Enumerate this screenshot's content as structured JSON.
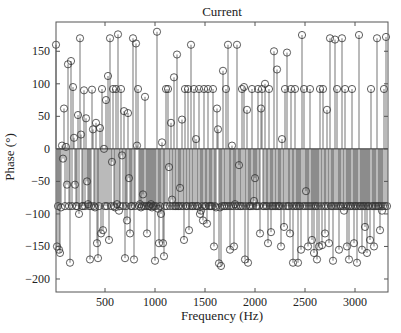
{
  "chart_data": {
    "type": "stem",
    "title": "Current",
    "xlabel": "Frequency (Hz)",
    "ylabel": "Phase (°)",
    "xlim": [
      10,
      3330
    ],
    "ylim": [
      -220,
      195
    ],
    "xticks": [
      500,
      1000,
      1500,
      2000,
      2500,
      3000
    ],
    "yticks": [
      -200,
      -150,
      -100,
      -50,
      0,
      50,
      100,
      150
    ],
    "grid": false,
    "legend": null,
    "marker": "open-circle",
    "color": "#333333",
    "x": [
      10,
      20,
      30,
      40,
      50,
      60,
      70,
      80,
      90,
      100,
      110,
      120,
      130,
      140,
      150,
      160,
      170,
      180,
      190,
      200,
      210,
      220,
      230,
      240,
      250,
      260,
      270,
      280,
      290,
      300,
      310,
      320,
      330,
      340,
      350,
      360,
      370,
      380,
      390,
      400,
      410,
      420,
      430,
      440,
      450,
      460,
      470,
      480,
      490,
      500,
      510,
      520,
      530,
      540,
      550,
      560,
      570,
      580,
      590,
      600,
      610,
      620,
      630,
      640,
      650,
      660,
      670,
      680,
      690,
      700,
      710,
      720,
      730,
      740,
      750,
      760,
      770,
      780,
      790,
      800,
      810,
      820,
      830,
      840,
      850,
      860,
      870,
      880,
      890,
      900,
      910,
      920,
      930,
      940,
      950,
      960,
      970,
      980,
      990,
      1000,
      1010,
      1020,
      1030,
      1040,
      1050,
      1060,
      1070,
      1080,
      1090,
      1100,
      1110,
      1120,
      1130,
      1140,
      1150,
      1160,
      1170,
      1180,
      1190,
      1200,
      1210,
      1220,
      1230,
      1240,
      1250,
      1260,
      1270,
      1280,
      1290,
      1300,
      1310,
      1320,
      1330,
      1340,
      1350,
      1360,
      1370,
      1380,
      1390,
      1400,
      1410,
      1420,
      1430,
      1440,
      1450,
      1460,
      1470,
      1480,
      1490,
      1500,
      1510,
      1520,
      1530,
      1540,
      1550,
      1560,
      1570,
      1580,
      1590,
      1600,
      1610,
      1620,
      1630,
      1640,
      1650,
      1660,
      1670,
      1680,
      1690,
      1700,
      1710,
      1720,
      1730,
      1740,
      1750,
      1760,
      1770,
      1780,
      1790,
      1800,
      1810,
      1820,
      1830,
      1840,
      1850,
      1860,
      1870,
      1880,
      1890,
      1900,
      1910,
      1920,
      1930,
      1940,
      1950,
      1960,
      1970,
      1980,
      1990,
      2000,
      2010,
      2020,
      2030,
      2040,
      2050,
      2060,
      2070,
      2080,
      2090,
      2100,
      2110,
      2120,
      2130,
      2140,
      2150,
      2160,
      2170,
      2180,
      2190,
      2200,
      2210,
      2220,
      2230,
      2240,
      2250,
      2260,
      2270,
      2280,
      2290,
      2300,
      2310,
      2320,
      2330,
      2340,
      2350,
      2360,
      2370,
      2380,
      2390,
      2400,
      2410,
      2420,
      2430,
      2440,
      2450,
      2460,
      2470,
      2480,
      2490,
      2500,
      2510,
      2520,
      2530,
      2540,
      2550,
      2560,
      2570,
      2580,
      2590,
      2600,
      2610,
      2620,
      2630,
      2640,
      2650,
      2660,
      2670,
      2680,
      2690,
      2700,
      2710,
      2720,
      2730,
      2740,
      2750,
      2760,
      2770,
      2780,
      2790,
      2800,
      2810,
      2820,
      2830,
      2840,
      2850,
      2860,
      2870,
      2880,
      2890,
      2900,
      2910,
      2920,
      2930,
      2940,
      2950,
      2960,
      2970,
      2980,
      2990,
      3000,
      3010,
      3020,
      3030,
      3040,
      3050,
      3060,
      3070,
      3080,
      3090,
      3100,
      3110,
      3120,
      3130,
      3140,
      3150,
      3160,
      3170,
      3180,
      3190,
      3200,
      3210,
      3220,
      3230,
      3240,
      3250,
      3260,
      3270,
      3280,
      3290,
      3300,
      3310,
      3320
    ],
    "y": [
      160,
      -150,
      -88,
      -155,
      -160,
      -90,
      5,
      -15,
      62,
      -88,
      3,
      -55,
      130,
      -88,
      -175,
      135,
      -88,
      95,
      17,
      -55,
      -88,
      -88,
      52,
      -100,
      170,
      22,
      -88,
      -88,
      90,
      -88,
      47,
      -50,
      -85,
      -88,
      -170,
      -88,
      91,
      30,
      -88,
      -90,
      40,
      -145,
      -168,
      -88,
      32,
      -130,
      92,
      -125,
      0,
      -88,
      75,
      -88,
      112,
      -140,
      170,
      -88,
      -20,
      92,
      -88,
      -90,
      92,
      -85,
      176,
      -95,
      -88,
      92,
      -10,
      -88,
      58,
      -168,
      -88,
      -110,
      55,
      -45,
      -130,
      -88,
      -88,
      170,
      -170,
      -88,
      162,
      5,
      92,
      -88,
      -85,
      -90,
      -88,
      -70,
      -88,
      80,
      -88,
      -130,
      -88,
      -88,
      -88,
      -85,
      -90,
      -88,
      -88,
      -172,
      -88,
      180,
      -92,
      -145,
      -88,
      -100,
      10,
      -145,
      -165,
      -88,
      92,
      -88,
      92,
      -28,
      -88,
      40,
      -78,
      -88,
      110,
      -88,
      -88,
      145,
      -88,
      -88,
      -60,
      -88,
      45,
      -88,
      -140,
      92,
      -88,
      -88,
      92,
      -125,
      -88,
      160,
      -88,
      -88,
      92,
      -88,
      15,
      -88,
      -88,
      92,
      -100,
      -95,
      -88,
      -110,
      92,
      -88,
      -88,
      -115,
      92,
      -88,
      -88,
      -88,
      -88,
      92,
      -150,
      -88,
      -90,
      62,
      30,
      -176,
      -90,
      -180,
      -88,
      120,
      -88,
      -88,
      92,
      -88,
      160,
      -88,
      -155,
      -88,
      5,
      -88,
      -150,
      -85,
      -88,
      160,
      -88,
      -25,
      -88,
      -88,
      92,
      -88,
      95,
      -170,
      -88,
      60,
      -175,
      -88,
      -88,
      -88,
      92,
      -88,
      -80,
      -45,
      -88,
      -88,
      92,
      -88,
      -130,
      62,
      92,
      -88,
      -88,
      100,
      -88,
      -88,
      -145,
      92,
      -88,
      -128,
      -88,
      -88,
      150,
      -88,
      -88,
      122,
      -88,
      -88,
      -88,
      -150,
      15,
      -88,
      -120,
      92,
      -88,
      148,
      -88,
      -88,
      -130,
      92,
      -88,
      -175,
      -88,
      92,
      -88,
      -88,
      -175,
      -88,
      -88,
      -155,
      175,
      -88,
      92,
      -88,
      -65,
      -88,
      -150,
      -88,
      92,
      -88,
      -140,
      -88,
      -160,
      -88,
      -88,
      -170,
      -88,
      -150,
      92,
      -88,
      -148,
      92,
      -88,
      -130,
      -88,
      60,
      -88,
      -145,
      170,
      -88,
      -88,
      -172,
      -88,
      168,
      -88,
      92,
      -88,
      -155,
      -88,
      -88,
      170,
      -88,
      -95,
      92,
      -88,
      -150,
      -88,
      -170,
      -88,
      -88,
      92,
      -88,
      -145,
      -88,
      -88,
      -175,
      -88,
      175,
      -88,
      -88,
      -155,
      -88,
      -88,
      -120,
      -88,
      -160,
      -88,
      -88,
      -140,
      92,
      -88,
      -88,
      -150,
      -88,
      -88,
      170,
      -88,
      -88,
      -125,
      -88,
      -95,
      -88,
      92,
      -88,
      172,
      -88,
      165,
      -88,
      -88,
      -145,
      -88,
      -145,
      -88,
      -88,
      150,
      -88,
      -85,
      -88,
      92,
      -88,
      -172,
      92,
      -88
    ],
    "tick_color": "#444444",
    "axis_color": "#555555"
  }
}
